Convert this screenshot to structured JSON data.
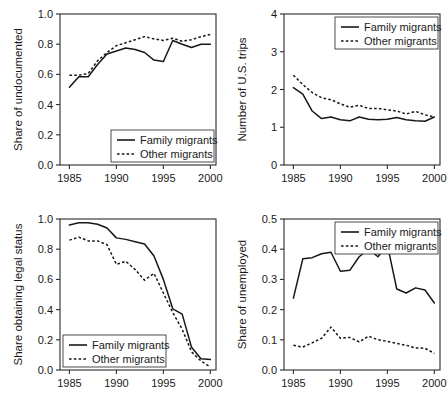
{
  "figure": {
    "legend": {
      "solid_label": "Family migrants",
      "dotted_label": "Other migrants"
    },
    "line_color": "#171717",
    "axis_color": "#2b2b2b"
  },
  "chart_data": [
    {
      "type": "line",
      "panel": "top-left",
      "title": "",
      "xlabel": "",
      "ylabel": "Share of undocumented",
      "xlim": [
        1984,
        2000.6
      ],
      "ylim": [
        0.0,
        1.0
      ],
      "xticks": [
        1985,
        1990,
        1995,
        2000
      ],
      "xtick_labels": [
        "1985",
        "1990",
        "1995",
        "2000"
      ],
      "yticks": [
        0.0,
        0.2,
        0.4,
        0.6,
        0.8,
        1.0
      ],
      "ytick_labels": [
        "0.0",
        "0.2",
        "0.4",
        "0.6",
        "0.8",
        "1.0"
      ],
      "grid": false,
      "legend_position": "bottom-right",
      "x": [
        1985,
        1986,
        1987,
        1988,
        1989,
        1990,
        1991,
        1992,
        1993,
        1994,
        1995,
        1996,
        1997,
        1998,
        1999,
        2000
      ],
      "series": [
        {
          "name": "Family migrants",
          "style": "solid",
          "values": [
            0.515,
            0.585,
            0.585,
            0.665,
            0.735,
            0.755,
            0.775,
            0.765,
            0.745,
            0.695,
            0.685,
            0.825,
            0.8,
            0.778,
            0.8,
            0.8
          ]
        },
        {
          "name": "Other migrants",
          "style": "dotted",
          "values": [
            0.595,
            0.595,
            0.605,
            0.69,
            0.745,
            0.79,
            0.81,
            0.83,
            0.85,
            0.835,
            0.825,
            0.84,
            0.82,
            0.83,
            0.85,
            0.865
          ]
        }
      ]
    },
    {
      "type": "line",
      "panel": "top-right",
      "title": "",
      "xlabel": "",
      "ylabel": "Number of U.S. trips",
      "xlim": [
        1984,
        2000.6
      ],
      "ylim": [
        0,
        4
      ],
      "xticks": [
        1985,
        1990,
        1995,
        2000
      ],
      "xtick_labels": [
        "1985",
        "1990",
        "1995",
        "2000"
      ],
      "yticks": [
        0,
        1,
        2,
        3,
        4
      ],
      "ytick_labels": [
        "0",
        "1",
        "2",
        "3",
        "4"
      ],
      "grid": false,
      "legend_position": "top-right",
      "x": [
        1985,
        1986,
        1987,
        1988,
        1989,
        1990,
        1991,
        1992,
        1993,
        1994,
        1995,
        1996,
        1997,
        1998,
        1999,
        2000
      ],
      "series": [
        {
          "name": "Family migrants",
          "style": "solid",
          "values": [
            2.05,
            1.88,
            1.43,
            1.23,
            1.27,
            1.2,
            1.17,
            1.27,
            1.21,
            1.2,
            1.21,
            1.26,
            1.2,
            1.17,
            1.16,
            1.27
          ]
        },
        {
          "name": "Other migrants",
          "style": "dotted",
          "values": [
            2.38,
            2.13,
            1.92,
            1.78,
            1.73,
            1.62,
            1.53,
            1.58,
            1.5,
            1.5,
            1.46,
            1.43,
            1.35,
            1.42,
            1.33,
            1.27
          ]
        }
      ]
    },
    {
      "type": "line",
      "panel": "bottom-left",
      "title": "",
      "xlabel": "",
      "ylabel": "Share obtaining legal status",
      "xlim": [
        1984,
        2000.6
      ],
      "ylim": [
        0.0,
        1.0
      ],
      "xticks": [
        1985,
        1990,
        1995,
        2000
      ],
      "xtick_labels": [
        "1985",
        "1990",
        "1995",
        "2000"
      ],
      "yticks": [
        0.0,
        0.2,
        0.4,
        0.6,
        0.8,
        1.0
      ],
      "ytick_labels": [
        "0.0",
        "0.2",
        "0.4",
        "0.6",
        "0.8",
        "1.0"
      ],
      "grid": false,
      "legend_position": "bottom-left",
      "x": [
        1985,
        1986,
        1987,
        1988,
        1989,
        1990,
        1991,
        1992,
        1993,
        1994,
        1995,
        1996,
        1997,
        1998,
        1999,
        2000
      ],
      "series": [
        {
          "name": "Family migrants",
          "style": "solid",
          "values": [
            0.96,
            0.975,
            0.975,
            0.965,
            0.94,
            0.875,
            0.865,
            0.85,
            0.835,
            0.755,
            0.6,
            0.405,
            0.37,
            0.15,
            0.075,
            0.07
          ]
        },
        {
          "name": "Other migrants",
          "style": "dotted",
          "values": [
            0.86,
            0.88,
            0.855,
            0.855,
            0.83,
            0.7,
            0.72,
            0.665,
            0.595,
            0.64,
            0.51,
            0.38,
            0.27,
            0.12,
            0.06,
            0.02
          ]
        }
      ]
    },
    {
      "type": "line",
      "panel": "bottom-right",
      "title": "",
      "xlabel": "",
      "ylabel": "Share of unemployed",
      "xlim": [
        1984,
        2000.6
      ],
      "ylim": [
        0.0,
        0.5
      ],
      "xticks": [
        1985,
        1990,
        1995,
        2000
      ],
      "xtick_labels": [
        "1985",
        "1990",
        "1995",
        "2000"
      ],
      "yticks": [
        0.0,
        0.1,
        0.2,
        0.3,
        0.4,
        0.5
      ],
      "ytick_labels": [
        "0.0",
        "0.1",
        "0.2",
        "0.3",
        "0.4",
        "0.5"
      ],
      "grid": false,
      "legend_position": "top-right",
      "x": [
        1985,
        1986,
        1987,
        1988,
        1989,
        1990,
        1991,
        1992,
        1993,
        1994,
        1995,
        1996,
        1997,
        1998,
        1999,
        2000
      ],
      "series": [
        {
          "name": "Family migrants",
          "style": "solid",
          "values": [
            0.238,
            0.368,
            0.372,
            0.385,
            0.39,
            0.327,
            0.33,
            0.375,
            0.4,
            0.375,
            0.415,
            0.268,
            0.255,
            0.272,
            0.265,
            0.222
          ]
        },
        {
          "name": "Other migrants",
          "style": "dotted",
          "values": [
            0.082,
            0.076,
            0.09,
            0.105,
            0.142,
            0.105,
            0.108,
            0.093,
            0.112,
            0.1,
            0.095,
            0.088,
            0.082,
            0.073,
            0.072,
            0.055
          ]
        }
      ]
    }
  ]
}
